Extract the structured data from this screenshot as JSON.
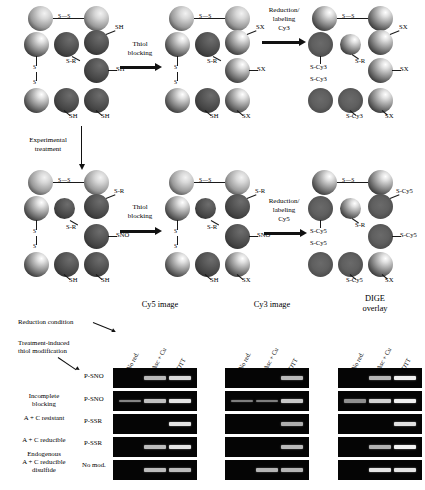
{
  "schematic": {
    "disulfide_glyph": "S—S",
    "arrows": [
      {
        "label": "Thiol\nblocking"
      },
      {
        "label": "Reduction/\nlabeling\nCy3"
      },
      {
        "label": "Experimental\ntreatment"
      },
      {
        "label": "Thiol\nblocking"
      },
      {
        "label": "Reduction/\nlabeling\nCy5"
      }
    ],
    "panels": [
      {
        "name": "panel-top-1",
        "labels": [
          "SH",
          "S-R",
          "SH",
          "SH",
          "SH"
        ]
      },
      {
        "name": "panel-top-2",
        "labels": [
          "SX",
          "S-R",
          "SX",
          "SH",
          "SX"
        ]
      },
      {
        "name": "panel-top-3",
        "labels": [
          "SX",
          "S-R",
          "SX",
          "S-Cy3",
          "S-Cy3",
          "S-Cy3",
          "SX"
        ]
      },
      {
        "name": "panel-bottom-1",
        "labels": [
          "S-R",
          "S-R",
          "SNO",
          "SH",
          "SH"
        ]
      },
      {
        "name": "panel-bottom-2",
        "labels": [
          "S-R",
          "S-R",
          "SNO",
          "SH",
          "SX"
        ]
      },
      {
        "name": "panel-bottom-3",
        "labels": [
          "S-Cy5",
          "S-R",
          "S-Cy5",
          "S-Cy5",
          "S-Cy5",
          "S-Cy5",
          "SX"
        ]
      }
    ]
  },
  "gels": {
    "annotations": {
      "reduction_condition": "Reduction condition",
      "thiol_modification": "Treatment-induced\nthiol modification"
    },
    "panel_titles": [
      "Cy5 image",
      "Cy3 image",
      "DIGE\noverlay"
    ],
    "lanes": [
      "No red.",
      "Asc + Cu",
      "DTT"
    ],
    "row_descriptions": [
      "",
      "Incomplete\nblocking",
      "A + C resistant",
      "A + C reducible",
      "Endogenous\nA + C reducible\ndisulfide"
    ],
    "row_modifications": [
      "P-SNO",
      "P-SNO",
      "P-SSR",
      "P-SSR",
      "No mod."
    ],
    "intensity": {
      "Cy5": [
        [
          0,
          0.62,
          0.8
        ],
        [
          0.34,
          0.66,
          0.86
        ],
        [
          0,
          0,
          0.86
        ],
        [
          0,
          0.64,
          0.86
        ],
        [
          0,
          0.64,
          0.64
        ]
      ],
      "Cy3": [
        [
          0,
          0,
          0.62
        ],
        [
          0.3,
          0.3,
          0.7
        ],
        [
          0,
          0,
          0.56
        ],
        [
          0,
          0,
          0.62
        ],
        [
          0,
          0.6,
          0.6
        ]
      ],
      "DIGE": [
        [
          0,
          0.6,
          0.92
        ],
        [
          0.4,
          0.76,
          0.92
        ],
        [
          0,
          0,
          0.84
        ],
        [
          0,
          0.58,
          0.94
        ],
        [
          0,
          0.86,
          0.86
        ]
      ]
    }
  }
}
